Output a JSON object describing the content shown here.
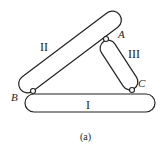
{
  "diagram": {
    "bars": [
      {
        "id": "I",
        "label": "I"
      },
      {
        "id": "II",
        "label": "II"
      },
      {
        "id": "III",
        "label": "III"
      }
    ],
    "joints": [
      {
        "id": "A",
        "label": "A"
      },
      {
        "id": "B",
        "label": "B"
      },
      {
        "id": "C",
        "label": "C"
      }
    ],
    "caption": "(a)",
    "colors": {
      "stroke": "#222222",
      "background": "#ffffff"
    }
  }
}
